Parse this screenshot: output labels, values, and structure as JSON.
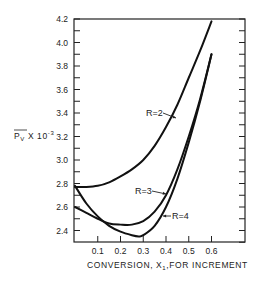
{
  "chart_data": {
    "type": "line",
    "title": "",
    "xlabel": "CONVERSION, X1, FOR INCREMENT",
    "ylabel": "Pv X 10^-3",
    "xlim": [
      0,
      0.7
    ],
    "ylim": [
      2.31,
      4.2
    ],
    "x_ticks": [
      "0.1",
      "0.2",
      "0.3",
      "0.4",
      "0.5",
      "0.6"
    ],
    "y_ticks": [
      "2.4",
      "2.6",
      "2.8",
      "3.0",
      "3.2",
      "3.4",
      "3.6",
      "3.8",
      "4.0",
      "4.2"
    ],
    "grid": false,
    "legend": "inline annotations with arrows",
    "series": [
      {
        "name": "R=2",
        "x": [
          0,
          0.05,
          0.1,
          0.15,
          0.2,
          0.25,
          0.3,
          0.35,
          0.4,
          0.45,
          0.5,
          0.55,
          0.6
        ],
        "values": [
          2.77,
          2.77,
          2.78,
          2.81,
          2.86,
          2.92,
          3.0,
          3.12,
          3.28,
          3.47,
          3.7,
          3.93,
          4.18
        ]
      },
      {
        "name": "R=3",
        "x": [
          0,
          0.05,
          0.1,
          0.15,
          0.2,
          0.25,
          0.3,
          0.35,
          0.4,
          0.45,
          0.5,
          0.55,
          0.6
        ],
        "values": [
          2.6,
          2.55,
          2.5,
          2.46,
          2.45,
          2.45,
          2.48,
          2.56,
          2.7,
          2.92,
          3.2,
          3.52,
          3.9
        ]
      },
      {
        "name": "R=4",
        "x": [
          0,
          0.05,
          0.1,
          0.15,
          0.2,
          0.25,
          0.28,
          0.3,
          0.35,
          0.4,
          0.45,
          0.5,
          0.55,
          0.6
        ],
        "values": [
          2.78,
          2.63,
          2.52,
          2.44,
          2.39,
          2.36,
          2.35,
          2.36,
          2.44,
          2.6,
          2.84,
          3.15,
          3.5,
          3.9
        ]
      }
    ],
    "annotations": [
      {
        "text": "R=2",
        "x": 0.35,
        "y": 3.33
      },
      {
        "text": "R=3",
        "x": 0.38,
        "y": 2.68
      },
      {
        "text": "R=4",
        "x": 0.47,
        "y": 2.5
      }
    ]
  },
  "labels": {
    "ylabel_main": "P",
    "ylabel_sub": "V",
    "ylabel_mult": "X 10",
    "ylabel_exp": "-3",
    "xlabel_a": "CONVERSION, X",
    "xlabel_sub": "1",
    "xlabel_b": ",FOR INCREMENT"
  }
}
